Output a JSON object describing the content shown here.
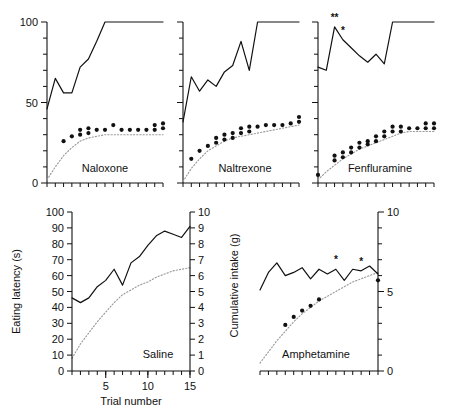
{
  "figure": {
    "background": "#ffffff",
    "ink": "#111111",
    "dotted_color": "#9a9a9a"
  },
  "axis_labels": {
    "eating_latency": "Eating latency (s)",
    "cumulative_intake": "Cumulative intake (g)",
    "trial_number": "Trial number"
  },
  "panels": [
    {
      "id": "naloxone",
      "label": "Naloxone",
      "row": "top",
      "y_ticks_major": [
        0,
        50,
        100
      ],
      "y_tick_labels": [
        "0",
        "50",
        "100"
      ],
      "x_tick_count": 15,
      "significance": []
    },
    {
      "id": "naltrexone",
      "label": "Naltrexone",
      "row": "top",
      "y_ticks_major": [],
      "y_tick_labels": [],
      "x_tick_count": 15,
      "significance": []
    },
    {
      "id": "fenfluramine",
      "label": "Fenfluramine",
      "row": "top",
      "y_ticks_major": [],
      "y_tick_labels": [],
      "x_tick_count": 15,
      "significance": [
        {
          "trial": 3,
          "mark": "**"
        },
        {
          "trial": 4,
          "mark": "*"
        }
      ]
    },
    {
      "id": "saline",
      "label": "Saline",
      "row": "bottom",
      "y_tick_labels_left": [
        "0",
        "10",
        "20",
        "30",
        "40",
        "50",
        "60",
        "70",
        "80",
        "90",
        "100"
      ],
      "y_tick_labels_right": [
        "0",
        "1",
        "2",
        "3",
        "4",
        "5",
        "6",
        "7",
        "8",
        "9",
        "10"
      ],
      "x_tick_labels": [
        "5",
        "10",
        "15"
      ],
      "x_tick_count": 15,
      "significance": []
    },
    {
      "id": "amphetamine",
      "label": "Amphetamine",
      "row": "bottom",
      "y_tick_labels_right": [
        "0",
        "5",
        "10"
      ],
      "x_tick_count": 15,
      "significance": [
        {
          "trial": 10,
          "mark": "*"
        },
        {
          "trial": 13,
          "mark": "*"
        }
      ]
    }
  ],
  "chart_data": {
    "type": "line",
    "title": "",
    "xlabel": "Trial number",
    "ylabel_left": "Eating latency (s)",
    "ylabel_right": "Cumulative intake (g)",
    "xlim": [
      1,
      15
    ],
    "ylim_left": [
      0,
      100
    ],
    "ylim_right": [
      0,
      10
    ],
    "grid": false,
    "legend": "none",
    "charts": [
      {
        "panel": "naloxone",
        "ylim_left": [
          0,
          100
        ],
        "ylim_right": [
          0,
          10
        ],
        "series": [
          {
            "name": "Eating latency (s)",
            "style": "solid-line",
            "x": [
              1,
              2,
              3,
              4,
              5,
              6,
              7,
              8,
              9,
              10,
              11,
              12,
              13,
              14,
              15
            ],
            "values": [
              46,
              65,
              56,
              56,
              72,
              77,
              88,
              100,
              100,
              100,
              100,
              100,
              100,
              100,
              100
            ]
          },
          {
            "name": "Cumulative intake (g) observed",
            "style": "filled-dots",
            "x": [
              3,
              4,
              5,
              5,
              6,
              6,
              7,
              8,
              9,
              10,
              11,
              12,
              13,
              14,
              14,
              15,
              15
            ],
            "values": [
              2.6,
              2.9,
              3.0,
              3.3,
              3.1,
              3.4,
              3.3,
              3.3,
              3.6,
              3.3,
              3.3,
              3.3,
              3.3,
              3.3,
              3.6,
              3.4,
              3.7
            ]
          },
          {
            "name": "Cumulative intake (g) predicted",
            "style": "dotted-line",
            "x": [
              1,
              2,
              3,
              4,
              5,
              6,
              7,
              8,
              9,
              10,
              11,
              12,
              13,
              14,
              15
            ],
            "values": [
              0.2,
              1.0,
              1.7,
              2.2,
              2.6,
              2.8,
              2.9,
              3.0,
              3.0,
              3.0,
              3.0,
              3.0,
              3.0,
              3.0,
              3.0
            ]
          }
        ]
      },
      {
        "panel": "naltrexone",
        "ylim_left": [
          0,
          100
        ],
        "ylim_right": [
          0,
          10
        ],
        "series": [
          {
            "name": "Eating latency (s)",
            "style": "solid-line",
            "x": [
              1,
              2,
              3,
              4,
              5,
              6,
              7,
              8,
              9,
              10,
              11,
              12,
              13,
              14,
              15
            ],
            "values": [
              38,
              66,
              57,
              64,
              60,
              69,
              73,
              88,
              70,
              100,
              100,
              100,
              100,
              100,
              100
            ]
          },
          {
            "name": "Cumulative intake (g) observed",
            "style": "filled-dots",
            "x": [
              2,
              3,
              4,
              5,
              5,
              6,
              6,
              7,
              7,
              8,
              8,
              9,
              9,
              10,
              11,
              12,
              13,
              14,
              15,
              15
            ],
            "values": [
              1.5,
              2.0,
              2.3,
              2.5,
              2.8,
              2.7,
              3.0,
              2.8,
              3.1,
              3.1,
              3.4,
              3.2,
              3.5,
              3.5,
              3.6,
              3.6,
              3.6,
              3.7,
              3.8,
              4.1
            ]
          },
          {
            "name": "Cumulative intake (g) predicted",
            "style": "dotted-line",
            "x": [
              1,
              2,
              3,
              4,
              5,
              6,
              7,
              8,
              9,
              10,
              11,
              12,
              13,
              14,
              15
            ],
            "values": [
              0.1,
              0.9,
              1.5,
              2.0,
              2.3,
              2.6,
              2.8,
              2.9,
              3.0,
              3.1,
              3.2,
              3.3,
              3.4,
              3.5,
              3.6
            ]
          }
        ]
      },
      {
        "panel": "fenfluramine",
        "ylim_left": [
          0,
          100
        ],
        "ylim_right": [
          0,
          10
        ],
        "series": [
          {
            "name": "Eating latency (s)",
            "style": "solid-line",
            "x": [
              1,
              2,
              3,
              4,
              5,
              6,
              7,
              8,
              9,
              10,
              11,
              12,
              13,
              14,
              15
            ],
            "values": [
              72,
              70,
              97,
              89,
              84,
              79,
              75,
              80,
              74,
              100,
              100,
              100,
              100,
              100,
              100
            ]
          },
          {
            "name": "Cumulative intake (g) observed",
            "style": "filled-dots",
            "x": [
              1,
              3,
              3,
              4,
              4,
              5,
              5,
              6,
              6,
              7,
              7,
              8,
              8,
              9,
              9,
              10,
              10,
              11,
              11,
              12,
              13,
              14,
              14,
              15,
              15
            ],
            "values": [
              0.5,
              1.4,
              1.7,
              1.6,
              1.9,
              1.9,
              2.2,
              2.2,
              2.5,
              2.4,
              2.6,
              2.6,
              2.9,
              2.9,
              3.2,
              3.2,
              3.5,
              3.2,
              3.5,
              3.4,
              3.4,
              3.4,
              3.7,
              3.4,
              3.7
            ]
          },
          {
            "name": "Cumulative intake (g) predicted",
            "style": "dotted-line",
            "x": [
              1,
              2,
              3,
              4,
              5,
              6,
              7,
              8,
              9,
              10,
              11,
              12,
              13,
              14,
              15
            ],
            "values": [
              0.2,
              0.7,
              1.1,
              1.5,
              1.8,
              2.1,
              2.3,
              2.5,
              2.7,
              2.9,
              3.1,
              3.2,
              3.2,
              3.2,
              3.2
            ]
          }
        ]
      },
      {
        "panel": "saline",
        "ylim_left": [
          0,
          100
        ],
        "ylim_right": [
          0,
          10
        ],
        "series": [
          {
            "name": "Eating latency (s)",
            "style": "solid-line",
            "x": [
              1,
              2,
              3,
              4,
              5,
              6,
              7,
              8,
              9,
              10,
              11,
              12,
              13,
              14,
              15
            ],
            "values": [
              46,
              43,
              46,
              53,
              57,
              64,
              54,
              68,
              72,
              79,
              85,
              88,
              86,
              84,
              91
            ]
          },
          {
            "name": "Cumulative intake (g) predicted",
            "style": "dotted-line",
            "x": [
              1,
              2,
              3,
              4,
              5,
              6,
              7,
              8,
              9,
              10,
              11,
              12,
              13,
              14,
              15
            ],
            "values": [
              0.8,
              1.7,
              2.4,
              3.1,
              3.7,
              4.3,
              4.8,
              5.1,
              5.4,
              5.6,
              5.9,
              6.1,
              6.3,
              6.4,
              6.5
            ]
          }
        ]
      },
      {
        "panel": "amphetamine",
        "ylim_left": [
          0,
          100
        ],
        "ylim_right": [
          0,
          10
        ],
        "series": [
          {
            "name": "Eating latency (s)",
            "style": "solid-line",
            "x": [
              1,
              2,
              3,
              4,
              5,
              6,
              7,
              8,
              9,
              10,
              11,
              12,
              13,
              14,
              15
            ],
            "values": [
              51,
              62,
              68,
              60,
              62,
              65,
              58,
              64,
              61,
              64,
              57,
              64,
              63,
              66,
              61
            ]
          },
          {
            "name": "Cumulative intake (g) observed",
            "style": "filled-dots",
            "x": [
              4,
              5,
              6,
              7,
              8,
              15
            ],
            "values": [
              2.9,
              3.4,
              3.8,
              4.1,
              4.5,
              5.7
            ]
          },
          {
            "name": "Cumulative intake (g) predicted",
            "style": "dotted-line",
            "x": [
              1,
              2,
              3,
              4,
              5,
              6,
              7,
              8,
              9,
              10,
              11,
              12,
              13,
              14,
              15
            ],
            "values": [
              0.5,
              1.2,
              1.9,
              2.5,
              3.1,
              3.6,
              4.0,
              4.4,
              4.7,
              5.0,
              5.3,
              5.6,
              5.8,
              6.0,
              6.2
            ]
          }
        ]
      }
    ]
  }
}
